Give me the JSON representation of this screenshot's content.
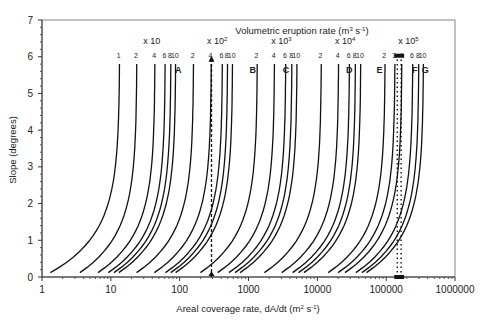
{
  "chart_data": {
    "type": "line",
    "title_parts": {
      "main": "Volumetric eruption rate (m",
      "sup1": "3",
      "mid": " s",
      "sup2": "-1",
      "end": ")"
    },
    "xlabel": "Areal coverage rate, dA/dt (m² s⁻¹)",
    "xlabel_parts": {
      "main": "Areal coverage rate, dA/dt (m",
      "sup1": "2",
      "mid": " s",
      "sup2": "-1",
      "end": ")"
    },
    "ylabel": "Slope (degrees)",
    "xscale": "log",
    "xlim": [
      1,
      1000000
    ],
    "ylim": [
      0,
      7
    ],
    "grid": false,
    "x_ticks": [
      "1",
      "10",
      "100",
      "1000",
      "10000",
      "100000",
      "1000000"
    ],
    "y_ticks": [
      "0",
      "1",
      "2",
      "3",
      "4",
      "5",
      "6",
      "7"
    ],
    "groups": [
      {
        "multiplier": "x 10",
        "exp": "",
        "labels": [
          "1",
          "2",
          "4",
          "6",
          "8",
          "10"
        ],
        "tops": [
          13.5,
          24,
          44,
          62,
          75,
          88
        ]
      },
      {
        "multiplier": "x 10",
        "exp": "2",
        "labels": [
          "2",
          "4",
          "6",
          "8",
          "10"
        ],
        "tops": [
          160,
          290,
          420,
          500,
          590
        ]
      },
      {
        "multiplier": "x 10",
        "exp": "3",
        "labels": [
          "2",
          "4",
          "6",
          "8",
          "10"
        ],
        "tops": [
          1350,
          2400,
          3500,
          4300,
          5100
        ]
      },
      {
        "multiplier": "x 10",
        "exp": "4",
        "labels": [
          "2",
          "4",
          "6",
          "8",
          "10"
        ],
        "tops": [
          11500,
          20500,
          29500,
          36000,
          43000
        ]
      },
      {
        "multiplier": "x 10",
        "exp": "5",
        "labels": [
          "2",
          "3",
          "4",
          "6",
          "8",
          "10"
        ],
        "tops": [
          97000,
          135000,
          170000,
          245000,
          300000,
          350000
        ]
      }
    ],
    "region_labels": [
      {
        "label": "A",
        "x": 95
      },
      {
        "label": "B",
        "x": 1150
      },
      {
        "label": "C",
        "x": 3500
      },
      {
        "label": "D",
        "x": 29000
      },
      {
        "label": "E",
        "x": 80000
      },
      {
        "label": "F",
        "x": 260000
      },
      {
        "label": "G",
        "x": 370000
      }
    ],
    "annotations": [
      {
        "type": "dashed-arrow",
        "x": 290,
        "from_slope": 0,
        "to_slope": 6
      },
      {
        "type": "dotted-lines",
        "x": [
          145000,
          165000
        ],
        "from_slope": 0,
        "to_slope": 6
      }
    ]
  }
}
